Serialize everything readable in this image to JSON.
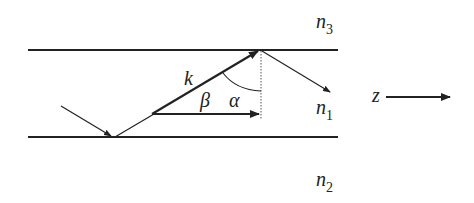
{
  "diagram": {
    "layers": {
      "top": {
        "symbol": "n",
        "subscript": "3"
      },
      "core": {
        "symbol": "n",
        "subscript": "1"
      },
      "bottom": {
        "symbol": "n",
        "subscript": "2"
      }
    },
    "vectors": {
      "wave_vector": "k"
    },
    "angles": {
      "beta": "β",
      "alpha": "α"
    },
    "axis": {
      "label": "z"
    },
    "colors": {
      "stroke": "#222222",
      "dotted": "#555555",
      "background": "#ffffff"
    }
  }
}
